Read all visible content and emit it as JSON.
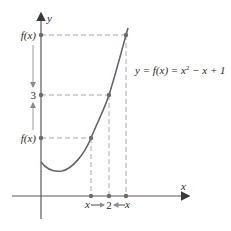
{
  "diagram": {
    "equation": "y = f(x) = x",
    "equation_exp": "2",
    "equation_tail": " − x + 1",
    "y_axis_label": "y",
    "x_axis_label": "x",
    "y_labels": {
      "top": "f(x)",
      "middle": "3",
      "bottom": "f(x)"
    },
    "x_labels": {
      "left": "x",
      "center": "2",
      "right": "x"
    },
    "colors": {
      "curve": "#6b5f6e",
      "axis": "#5a5a5a",
      "dashed": "#a8a8a8",
      "arrow": "#9a9a9a",
      "point": "#6b6b6b"
    }
  }
}
